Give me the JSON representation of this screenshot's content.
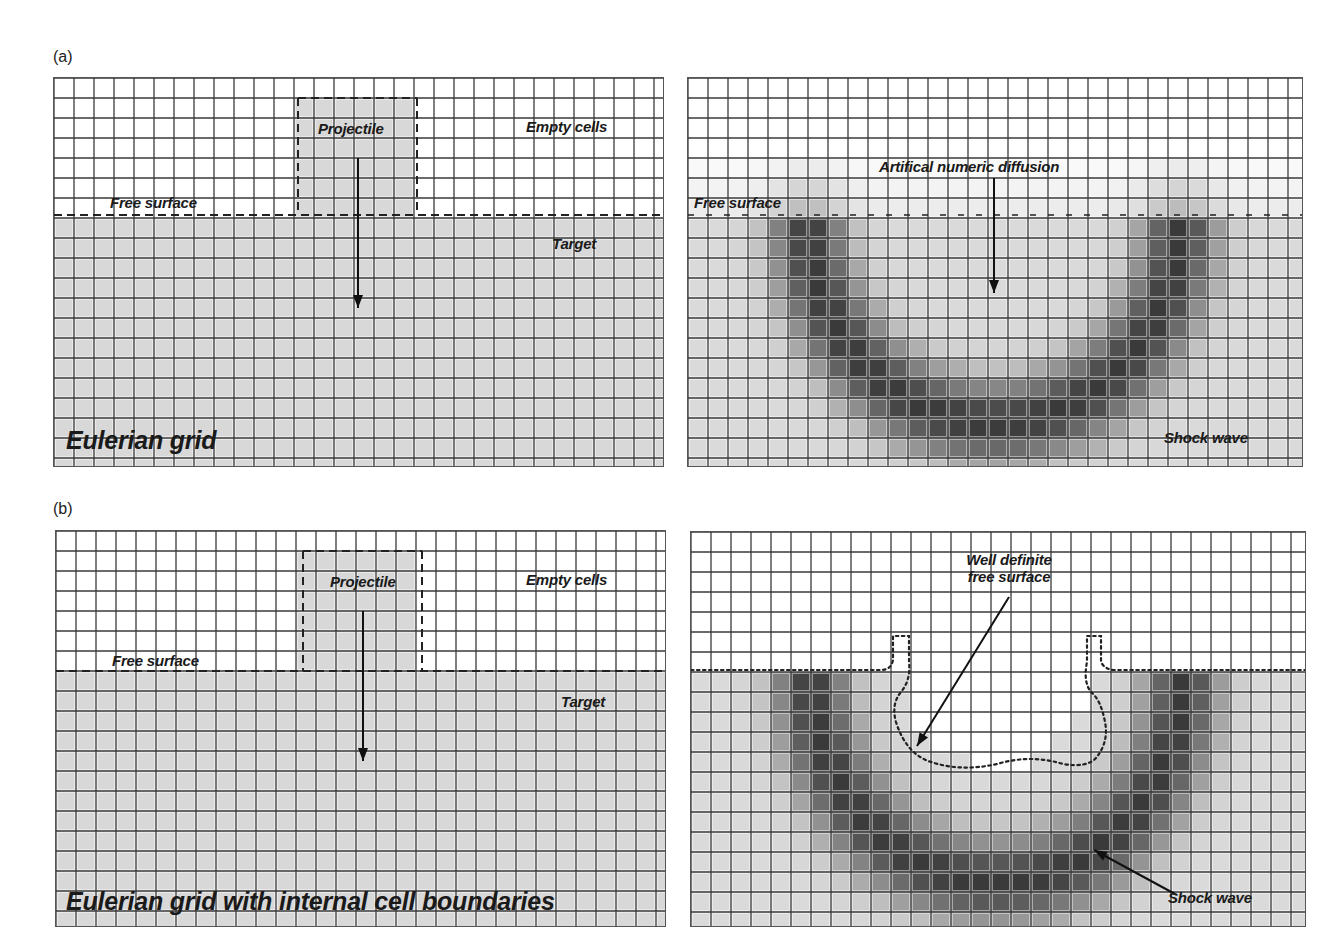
{
  "figure": {
    "panels": [
      {
        "id": "a",
        "label": "(a)",
        "left_title": "Eulerian grid",
        "left_labels": {
          "projectile": "Projectile",
          "empty_cells": "Empty cells",
          "free_surface": "Free surface",
          "target": "Target"
        },
        "right_labels": {
          "annotation": "Artifical numeric diffusion",
          "free_surface": "Free surface",
          "shock_wave": "Shock wave"
        }
      },
      {
        "id": "b",
        "label": "(b)",
        "left_title": "Eulerian grid with internal cell boundaries",
        "left_labels": {
          "projectile": "Projectile",
          "empty_cells": "Empty cells",
          "free_surface": "Free surface",
          "target": "Target"
        },
        "right_labels": {
          "annotation_line1": "Well definite",
          "annotation_line2": "free surface",
          "shock_wave": "Shock wave"
        }
      }
    ],
    "grid": {
      "cell_size_px": 20,
      "cols": 30,
      "rows": 19,
      "surface_row": 7,
      "colors": {
        "line": "#3a3a3a",
        "empty": "#ffffff",
        "material": "#d8d8d8",
        "shock_dark": "#4a4a4a"
      }
    }
  }
}
